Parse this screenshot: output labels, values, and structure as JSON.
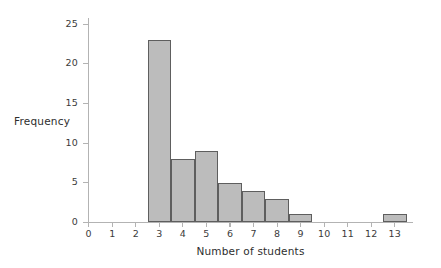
{
  "chart_data": {
    "type": "bar",
    "title": "",
    "subtitle": "",
    "xlabel": "Number of students",
    "ylabel": "Frequency",
    "grid": false,
    "legend": null,
    "xlim": [
      -0.5,
      13.8
    ],
    "ylim": [
      0,
      26.5
    ],
    "x_ticks": [
      0,
      1,
      2,
      3,
      4,
      5,
      6,
      7,
      8,
      9,
      10,
      11,
      12,
      13
    ],
    "x_tick_labels": [
      "0",
      "1",
      "2",
      "3",
      "4",
      "5",
      "6",
      "7",
      "8",
      "9",
      "10",
      "11",
      "12",
      "13"
    ],
    "y_ticks": [
      0,
      5,
      10,
      15,
      20,
      25
    ],
    "y_tick_labels": [
      "0",
      "5",
      "10",
      "15",
      "20",
      "25"
    ],
    "bin_width": 1,
    "categories": [
      0,
      1,
      2,
      3,
      4,
      5,
      6,
      7,
      8,
      9,
      10,
      11,
      12,
      13
    ],
    "values": [
      0,
      0,
      0,
      23,
      8,
      9,
      5,
      4,
      3,
      1,
      0,
      0,
      0,
      1
    ],
    "bars": [
      {
        "center": 3,
        "value": 23
      },
      {
        "center": 4,
        "value": 8
      },
      {
        "center": 5,
        "value": 9
      },
      {
        "center": 6,
        "value": 5
      },
      {
        "center": 7,
        "value": 4
      },
      {
        "center": 8,
        "value": 3
      },
      {
        "center": 9,
        "value": 1
      },
      {
        "center": 13,
        "value": 1
      }
    ],
    "colors": {
      "bar_fill": "#bcbcbc",
      "bar_edge": "#5e5e5e",
      "axis": "#b3b3b3",
      "text": "#2e2e2e",
      "background": "#ffffff"
    }
  }
}
